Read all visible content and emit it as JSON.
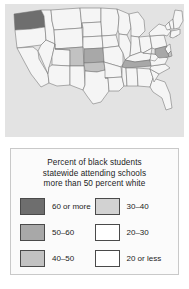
{
  "figure": {
    "kind": "choropleth-map",
    "background_color": "#ffffff"
  },
  "map": {
    "name": "united-states-choropleth",
    "panel_background": "#e3e3e3",
    "border_color": "#707070",
    "default_fill": "#f5f5f5"
  },
  "legend": {
    "title_line1": "Percent of black students",
    "title_line2": "statewide attending schools",
    "title_line3": "more than 50 percent white",
    "panel_background": "#fbfbfb",
    "panel_border": "#c9c9c9",
    "items": [
      {
        "label": "60 or more",
        "color": "#6e6e6e",
        "column": "left",
        "row": 1
      },
      {
        "label": "30–40",
        "color": "#d2d2d2",
        "column": "right",
        "row": 1
      },
      {
        "label": "50–60",
        "color": "#a8a8a8",
        "column": "left",
        "row": 2
      },
      {
        "label": "20–30",
        "color": "#ffffff",
        "column": "right",
        "row": 2
      },
      {
        "label": "40–50",
        "color": "#c2c2c2",
        "column": "left",
        "row": 3
      },
      {
        "label": "20 or less",
        "color": "#ffffff",
        "column": "right",
        "row": 3
      }
    ]
  },
  "chart_data": {
    "type": "heatmap",
    "title": "Percent of black students statewide attending schools more than 50 percent white",
    "xlabel": "",
    "ylabel": "",
    "categories": [
      "60 or more",
      "50–60",
      "40–50",
      "30–40",
      "20–30",
      "20 or less"
    ],
    "category_colors": [
      "#6e6e6e",
      "#a8a8a8",
      "#c2c2c2",
      "#d2d2d2",
      "#ffffff",
      "#ffffff"
    ],
    "legend_position": "bottom",
    "grid": false,
    "states": [
      {
        "state": "Washington",
        "abbr": "WA",
        "category": "60 or more",
        "color": "#6e6e6e"
      },
      {
        "state": "Kansas",
        "abbr": "KS",
        "category": "50–60",
        "color": "#a8a8a8"
      },
      {
        "state": "Tennessee",
        "abbr": "TN",
        "category": "50–60",
        "color": "#a8a8a8"
      },
      {
        "state": "Maryland",
        "abbr": "MD",
        "category": "50–60",
        "color": "#a8a8a8"
      },
      {
        "state": "Connecticut",
        "abbr": "CT",
        "category": "50–60",
        "color": "#a8a8a8"
      },
      {
        "state": "Colorado",
        "abbr": "CO",
        "category": "40–50",
        "color": "#c2c2c2"
      },
      {
        "state": "Oklahoma",
        "abbr": "OK",
        "category": "40–50",
        "color": "#c2c2c2"
      },
      {
        "state": "Delaware",
        "abbr": "DE",
        "category": "40–50",
        "color": "#c2c2c2"
      },
      {
        "state": "Rhode Island",
        "abbr": "RI",
        "category": "40–50",
        "color": "#c2c2c2"
      },
      {
        "state": "Oregon",
        "abbr": "OR",
        "category": "20 or less",
        "color": "#f5f5f5"
      },
      {
        "state": "California",
        "abbr": "CA",
        "category": "20 or less",
        "color": "#f5f5f5"
      },
      {
        "state": "Idaho",
        "abbr": "ID",
        "category": "20 or less",
        "color": "#f5f5f5"
      },
      {
        "state": "Nevada",
        "abbr": "NV",
        "category": "20 or less",
        "color": "#f5f5f5"
      },
      {
        "state": "Montana",
        "abbr": "MT",
        "category": "20 or less",
        "color": "#f5f5f5"
      },
      {
        "state": "Wyoming",
        "abbr": "WY",
        "category": "20 or less",
        "color": "#f5f5f5"
      },
      {
        "state": "Utah",
        "abbr": "UT",
        "category": "20 or less",
        "color": "#f5f5f5"
      },
      {
        "state": "Arizona",
        "abbr": "AZ",
        "category": "20 or less",
        "color": "#f5f5f5"
      },
      {
        "state": "New Mexico",
        "abbr": "NM",
        "category": "20 or less",
        "color": "#f5f5f5"
      },
      {
        "state": "North Dakota",
        "abbr": "ND",
        "category": "20 or less",
        "color": "#f5f5f5"
      },
      {
        "state": "South Dakota",
        "abbr": "SD",
        "category": "20 or less",
        "color": "#f5f5f5"
      },
      {
        "state": "Nebraska",
        "abbr": "NE",
        "category": "20 or less",
        "color": "#f5f5f5"
      },
      {
        "state": "Texas",
        "abbr": "TX",
        "category": "20 or less",
        "color": "#f5f5f5"
      },
      {
        "state": "Minnesota",
        "abbr": "MN",
        "category": "20 or less",
        "color": "#f5f5f5"
      },
      {
        "state": "Iowa",
        "abbr": "IA",
        "category": "20 or less",
        "color": "#f5f5f5"
      },
      {
        "state": "Missouri",
        "abbr": "MO",
        "category": "20 or less",
        "color": "#f5f5f5"
      },
      {
        "state": "Arkansas",
        "abbr": "AR",
        "category": "20 or less",
        "color": "#f5f5f5"
      },
      {
        "state": "Louisiana",
        "abbr": "LA",
        "category": "20 or less",
        "color": "#f5f5f5"
      },
      {
        "state": "Wisconsin",
        "abbr": "WI",
        "category": "20 or less",
        "color": "#f5f5f5"
      },
      {
        "state": "Illinois",
        "abbr": "IL",
        "category": "20 or less",
        "color": "#f5f5f5"
      },
      {
        "state": "Michigan",
        "abbr": "MI",
        "category": "20 or less",
        "color": "#f5f5f5"
      },
      {
        "state": "Indiana",
        "abbr": "IN",
        "category": "20 or less",
        "color": "#f5f5f5"
      },
      {
        "state": "Ohio",
        "abbr": "OH",
        "category": "20 or less",
        "color": "#f5f5f5"
      },
      {
        "state": "Kentucky",
        "abbr": "KY",
        "category": "20 or less",
        "color": "#f5f5f5"
      },
      {
        "state": "Mississippi",
        "abbr": "MS",
        "category": "20 or less",
        "color": "#f5f5f5"
      },
      {
        "state": "Alabama",
        "abbr": "AL",
        "category": "20 or less",
        "color": "#f5f5f5"
      },
      {
        "state": "Georgia",
        "abbr": "GA",
        "category": "20 or less",
        "color": "#f5f5f5"
      },
      {
        "state": "Florida",
        "abbr": "FL",
        "category": "20 or less",
        "color": "#f5f5f5"
      },
      {
        "state": "South Carolina",
        "abbr": "SC",
        "category": "20 or less",
        "color": "#f5f5f5"
      },
      {
        "state": "North Carolina",
        "abbr": "NC",
        "category": "20 or less",
        "color": "#f5f5f5"
      },
      {
        "state": "Virginia",
        "abbr": "VA",
        "category": "20 or less",
        "color": "#f5f5f5"
      },
      {
        "state": "West Virginia",
        "abbr": "WV",
        "category": "20 or less",
        "color": "#f5f5f5"
      },
      {
        "state": "Pennsylvania",
        "abbr": "PA",
        "category": "20 or less",
        "color": "#f5f5f5"
      },
      {
        "state": "New York",
        "abbr": "NY",
        "category": "20 or less",
        "color": "#f5f5f5"
      },
      {
        "state": "New Jersey",
        "abbr": "NJ",
        "category": "20 or less",
        "color": "#f5f5f5"
      },
      {
        "state": "Vermont",
        "abbr": "VT",
        "category": "20 or less",
        "color": "#f5f5f5"
      },
      {
        "state": "New Hampshire",
        "abbr": "NH",
        "category": "20 or less",
        "color": "#f5f5f5"
      },
      {
        "state": "Massachusetts",
        "abbr": "MA",
        "category": "20 or less",
        "color": "#f5f5f5"
      },
      {
        "state": "Maine",
        "abbr": "ME",
        "category": "20 or less",
        "color": "#f5f5f5"
      }
    ]
  }
}
